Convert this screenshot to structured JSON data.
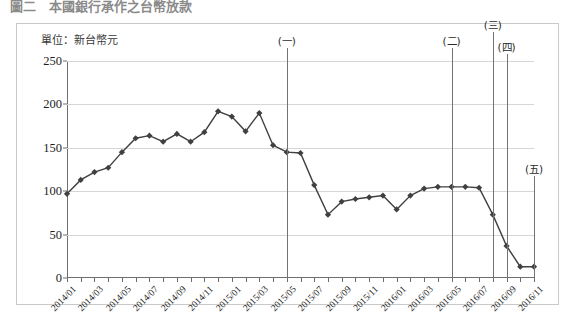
{
  "page_title": "圖二　本國銀行承作之台幣放款",
  "figure": {
    "unit_label": "單位：新台幣元"
  },
  "chart_data": {
    "type": "line",
    "title": "單位：新台幣元",
    "xlabel": "",
    "ylabel": "",
    "ylim": [
      0,
      250
    ],
    "ytick_step": 50,
    "ytick_labels": [
      "0",
      "50",
      "100",
      "150",
      "200",
      "250"
    ],
    "grid": true,
    "legend": false,
    "series_color": "#404040",
    "marker_shape": "diamond",
    "x_tick_labels": [
      "2014/01",
      "2014/03",
      "2014/05",
      "2014/07",
      "2014/09",
      "2014/11",
      "2015/01",
      "2015/03",
      "2015/05",
      "2015/07",
      "2015/09",
      "2015/11",
      "2016/01",
      "2016/03",
      "2016/05",
      "2016/07",
      "2016/09",
      "2016/11"
    ],
    "x": [
      "2014/01",
      "2014/02",
      "2014/03",
      "2014/04",
      "2014/05",
      "2014/06",
      "2014/07",
      "2014/08",
      "2014/09",
      "2014/10",
      "2014/11",
      "2014/12",
      "2015/01",
      "2015/02",
      "2015/03",
      "2015/04",
      "2015/05",
      "2015/06",
      "2015/07",
      "2015/08",
      "2015/09",
      "2015/10",
      "2015/11",
      "2015/12",
      "2016/01",
      "2016/02",
      "2016/03",
      "2016/04",
      "2016/05",
      "2016/06",
      "2016/07",
      "2016/08",
      "2016/09",
      "2016/10",
      "2016/11"
    ],
    "values": [
      97,
      113,
      122,
      127,
      145,
      161,
      164,
      157,
      166,
      157,
      168,
      192,
      186,
      169,
      190,
      153,
      145,
      144,
      107,
      73,
      88,
      91,
      93,
      95,
      79,
      95,
      103,
      105,
      105,
      105,
      104,
      73,
      37,
      13,
      13
    ],
    "annotations": [
      {
        "label": "(一)",
        "x": "2015/05",
        "index": 16,
        "label_y": 265
      },
      {
        "label": "(二)",
        "x": "2016/05",
        "index": 28,
        "label_y": 265
      },
      {
        "label": "(三)",
        "x": "2016/08",
        "index": 31,
        "label_y": 283
      },
      {
        "label": "(四)",
        "x": "2016/09",
        "index": 32,
        "label_y": 258
      },
      {
        "label": "(五)",
        "x": "2016/11",
        "index": 34,
        "label_y": 118
      }
    ]
  }
}
